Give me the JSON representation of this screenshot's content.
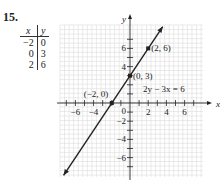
{
  "problem_number": "15.",
  "table": {
    "headers": [
      "x",
      "y"
    ],
    "rows": [
      [
        "−2",
        "0"
      ],
      [
        "0",
        "3"
      ],
      [
        "2",
        "6"
      ]
    ]
  },
  "chart_data": {
    "type": "line",
    "title": "",
    "equation": "2y − 3x = 6",
    "xlabel": "x",
    "ylabel": "y",
    "xlim": [
      -7.5,
      8
    ],
    "ylim": [
      -8.2,
      8.5
    ],
    "grid": true,
    "x_ticks": [
      -6,
      -4,
      2,
      4,
      6
    ],
    "y_ticks": [
      -6,
      -4,
      -2,
      4,
      6
    ],
    "origin_label": "0",
    "series": [
      {
        "name": "2y − 3x = 6",
        "slope": 1.5,
        "intercept": 3,
        "x": [
          -2,
          0,
          2
        ],
        "y": [
          0,
          3,
          6
        ]
      }
    ],
    "points": [
      {
        "label": "(−2, 0)",
        "x": -2,
        "y": 0
      },
      {
        "label": "(0, 3)",
        "x": 0,
        "y": 3
      },
      {
        "label": "(2, 6)",
        "x": 2,
        "y": 6
      }
    ]
  }
}
